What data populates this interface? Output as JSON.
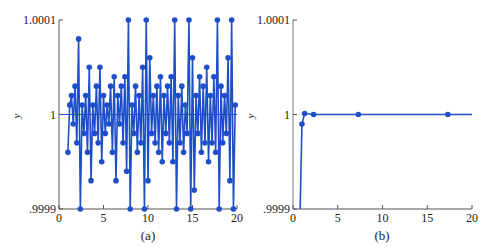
{
  "colors": {
    "series": "#1f4fc8",
    "axis": "#555555"
  },
  "chart_data": [
    {
      "type": "line",
      "panel": "a",
      "caption": "(a)",
      "xlabel": "",
      "ylabel": "y",
      "xlim": [
        0,
        20
      ],
      "ylim": [
        0.9999,
        1.0001
      ],
      "xticks": [
        "0",
        "5",
        "10",
        "15",
        "20"
      ],
      "yticks": [
        ".9999",
        "1",
        "1.0001"
      ],
      "markers": true,
      "reference_line": 1,
      "x": [
        1.0,
        1.2,
        1.4,
        1.6,
        1.8,
        2.0,
        2.2,
        2.4,
        2.6,
        2.8,
        3.0,
        3.2,
        3.4,
        3.6,
        3.8,
        4.0,
        4.2,
        4.4,
        4.6,
        4.8,
        5.0,
        5.2,
        5.4,
        5.6,
        5.8,
        6.0,
        6.2,
        6.4,
        6.6,
        6.8,
        7.0,
        7.2,
        7.4,
        7.6,
        7.8,
        8.0,
        8.2,
        8.4,
        8.6,
        8.8,
        9.0,
        9.2,
        9.4,
        9.6,
        9.8,
        10.0,
        10.2,
        10.4,
        10.6,
        10.8,
        11.0,
        11.2,
        11.4,
        11.6,
        11.8,
        12.0,
        12.2,
        12.4,
        12.6,
        12.8,
        13.0,
        13.2,
        13.4,
        13.6,
        13.8,
        14.0,
        14.2,
        14.4,
        14.6,
        14.8,
        15.0,
        15.2,
        15.4,
        15.6,
        15.8,
        16.0,
        16.2,
        16.4,
        16.6,
        16.8,
        17.0,
        17.2,
        17.4,
        17.6,
        17.8,
        18.0,
        18.2,
        18.4,
        18.6,
        18.8,
        19.0,
        19.2,
        19.4,
        19.6,
        19.8
      ],
      "y": [
        0.99996,
        1.00001,
        1.00002,
        0.99999,
        1.00003,
        0.99997,
        1.00008,
        0.9999,
        1.00001,
        0.99998,
        1.00002,
        0.99996,
        1.00005,
        0.99993,
        1.00001,
        0.99998,
        1.00003,
        0.99997,
        1.00005,
        0.99995,
        1.00002,
        0.99998,
        1.00001,
        0.99999,
        1.00003,
        0.99996,
        1.00004,
        0.99993,
        1.00002,
        0.99999,
        1.00003,
        0.99997,
        1.00004,
        0.99994,
        1.0001,
        0.9999,
        1.00001,
        0.99998,
        1.00003,
        0.99996,
        1.00002,
        0.99997,
        1.00005,
        0.9999,
        1.0001,
        0.99993,
        1.00006,
        0.99998,
        1.00002,
        0.99997,
        1.00003,
        0.99996,
        1.00004,
        0.99995,
        1.00002,
        0.99998,
        1.00003,
        0.99997,
        1.00004,
        0.99995,
        1.0001,
        0.9999,
        1.00002,
        0.99997,
        1.00003,
        0.99996,
        1.00001,
        0.99998,
        1.0001,
        0.9999,
        1.00006,
        0.99992,
        1.00002,
        0.99998,
        1.00004,
        0.99996,
        1.00003,
        0.99997,
        1.00005,
        0.99995,
        1.00002,
        0.99997,
        1.00004,
        0.99996,
        1.0001,
        0.9999,
        1.00003,
        0.99997,
        1.00002,
        0.99998,
        1.00006,
        0.99993,
        1.0001,
        0.9999,
        1.00001
      ]
    },
    {
      "type": "line",
      "panel": "b",
      "caption": "(b)",
      "xlabel": "",
      "ylabel": "y",
      "xlim": [
        0,
        20
      ],
      "ylim": [
        0.9999,
        1.0001
      ],
      "xticks": [
        "0",
        "5",
        "10",
        "15",
        "20"
      ],
      "yticks": [
        ".9999",
        "1",
        "1.0001"
      ],
      "markers": true,
      "x": [
        0.8,
        1.0,
        1.3,
        2.3,
        7.3,
        17.3,
        20.0
      ],
      "y": [
        0.9999,
        0.99999,
        1.000001,
        1.0,
        1.0,
        1.0,
        1.0
      ],
      "marker_indices": [
        1,
        2,
        3,
        4,
        5
      ]
    }
  ]
}
